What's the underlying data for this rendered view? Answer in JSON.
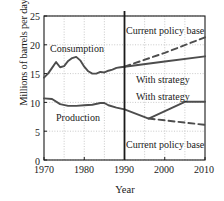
{
  "chart_data": {
    "type": "line",
    "title": "",
    "xlabel": "Year",
    "ylabel": "Millions of barrels per day",
    "xlim": [
      1970,
      2010
    ],
    "ylim": [
      0,
      25
    ],
    "xticks": [
      1970,
      1980,
      1990,
      2000,
      2010
    ],
    "yticks": [
      0,
      5,
      10,
      15,
      20,
      25
    ],
    "grid": true,
    "grid_style": "dotted",
    "legend_position": "inline-annotations",
    "annotations": [
      {
        "text": "Consumption",
        "x": 1976,
        "y": 19.6
      },
      {
        "text": "Production",
        "x": 1977,
        "y": 7.6
      },
      {
        "text": "Current policy base",
        "x": 1991,
        "y": 22.6
      },
      {
        "text": "With strategy",
        "x": 1993,
        "y": 14.2
      },
      {
        "text": "With strategy",
        "x": 1993,
        "y": 11.3
      },
      {
        "text": "Current policy base",
        "x": 1991,
        "y": 4.1
      }
    ],
    "divider_year": 1990,
    "series": [
      {
        "name": "Consumption (historical)",
        "style": "solid",
        "color": "#4d4d4d",
        "points": [
          [
            1970,
            14.3
          ],
          [
            1971,
            15.0
          ],
          [
            1972,
            16.0
          ],
          [
            1973,
            17.0
          ],
          [
            1974,
            16.1
          ],
          [
            1975,
            16.3
          ],
          [
            1976,
            17.2
          ],
          [
            1977,
            17.7
          ],
          [
            1978,
            17.9
          ],
          [
            1979,
            17.3
          ],
          [
            1980,
            16.2
          ],
          [
            1981,
            15.4
          ],
          [
            1982,
            15.0
          ],
          [
            1983,
            15.0
          ],
          [
            1984,
            15.3
          ],
          [
            1985,
            15.2
          ],
          [
            1986,
            15.5
          ],
          [
            1987,
            15.7
          ],
          [
            1988,
            16.0
          ],
          [
            1989,
            16.1
          ],
          [
            1990,
            16.2
          ]
        ]
      },
      {
        "name": "Consumption — Current policy base",
        "style": "dashed",
        "color": "#4d4d4d",
        "points": [
          [
            1990,
            16.2
          ],
          [
            2000,
            18.6
          ],
          [
            2010,
            21.3
          ]
        ]
      },
      {
        "name": "Consumption — With strategy",
        "style": "solid",
        "color": "#4d4d4d",
        "points": [
          [
            1990,
            16.2
          ],
          [
            2000,
            17.1
          ],
          [
            2010,
            18.0
          ]
        ]
      },
      {
        "name": "Production (historical)",
        "style": "solid",
        "color": "#4d4d4d",
        "points": [
          [
            1970,
            10.7
          ],
          [
            1972,
            10.6
          ],
          [
            1974,
            9.7
          ],
          [
            1976,
            9.4
          ],
          [
            1978,
            9.4
          ],
          [
            1980,
            9.5
          ],
          [
            1982,
            9.6
          ],
          [
            1984,
            9.9
          ],
          [
            1985,
            9.9
          ],
          [
            1986,
            9.5
          ],
          [
            1988,
            9.1
          ],
          [
            1990,
            8.8
          ]
        ]
      },
      {
        "name": "Production — With strategy",
        "style": "solid",
        "color": "#4d4d4d",
        "points": [
          [
            1990,
            8.8
          ],
          [
            1996,
            7.2
          ],
          [
            2005,
            10.1
          ],
          [
            2010,
            10.1
          ]
        ]
      },
      {
        "name": "Production — Current policy base",
        "style": "dashed",
        "color": "#4d4d4d",
        "points": [
          [
            1996,
            7.2
          ],
          [
            2010,
            6.1
          ]
        ]
      }
    ]
  },
  "axis": {
    "ylabel": "Millions of barrels per day",
    "xlabel": "Year",
    "yticks": [
      "0",
      "5",
      "10",
      "15",
      "20",
      "25"
    ],
    "xticks": [
      "1970",
      "1980",
      "1990",
      "2000",
      "2010"
    ]
  },
  "labels": {
    "consumption": "Consumption",
    "production": "Production",
    "policy_base_top": "Current policy base",
    "strategy_top": "With strategy",
    "strategy_bottom": "With strategy",
    "policy_base_bottom": "Current policy base"
  },
  "colors": {
    "line": "#4d4d4d",
    "axis": "#1a1a1a",
    "grid": "#b3b3b3",
    "divider": "#1a1a1a",
    "background": "#ffffff"
  }
}
